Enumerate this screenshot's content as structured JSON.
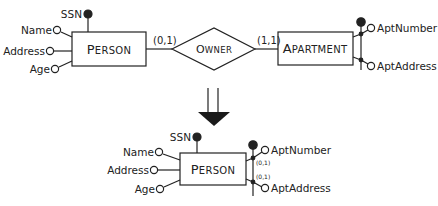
{
  "top_diagram": {
    "person": {
      "name_first": "P",
      "name_rest": "ERSON",
      "attributes": {
        "identifier": "SSN",
        "name": "Name",
        "address": "Address",
        "age": "Age"
      }
    },
    "relationship": {
      "name_first": "O",
      "name_rest": "WNER",
      "person_cardinality": "(0,1)",
      "apartment_cardinality": "(1,1)"
    },
    "apartment": {
      "name_first": "A",
      "name_rest": "PARTMENT",
      "attributes": {
        "apt_number": "AptNumber",
        "apt_address": "AptAddress"
      }
    }
  },
  "transformation_arrow": "down-arrow",
  "bottom_diagram": {
    "person": {
      "name_first": "P",
      "name_rest": "ERSON",
      "attributes": {
        "identifier": "SSN",
        "name": "Name",
        "address": "Address",
        "age": "Age",
        "apt_number": "AptNumber",
        "apt_address": "AptAddress"
      },
      "apt_number_cardinality": "(0,1)",
      "apt_address_cardinality": "(0,1)"
    }
  },
  "colors": {
    "stroke": "#222222",
    "background": "#ffffff"
  }
}
